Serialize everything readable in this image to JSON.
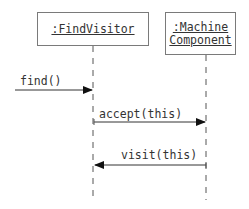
{
  "diagram": {
    "type": "sequence",
    "objects": [
      {
        "id": "findvisitor",
        "label_lines": [
          ":FindVisitor"
        ]
      },
      {
        "id": "machinecomponent",
        "label_lines": [
          ":Machine",
          "Component"
        ]
      }
    ],
    "messages": [
      {
        "label": "find()",
        "from": "external",
        "to": "findvisitor",
        "direction": "right"
      },
      {
        "label": "accept(this)",
        "from": "findvisitor",
        "to": "machinecomponent",
        "direction": "right"
      },
      {
        "label": "visit(this)",
        "from": "machinecomponent",
        "to": "findvisitor",
        "direction": "left"
      }
    ],
    "colors": {
      "line": "#555555",
      "box_border": "#7a7a7a",
      "text": "#333333"
    }
  }
}
